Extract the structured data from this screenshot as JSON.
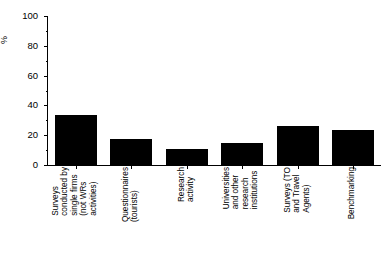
{
  "chart_data": {
    "type": "bar",
    "title": "",
    "xlabel": "",
    "ylabel": "%",
    "ylim": [
      0,
      100
    ],
    "grid": false,
    "legend": false,
    "categories": [
      "Surveys conducted by single firms (not WRs activities)",
      "Questionnaires (tourists)",
      "Research activity",
      "Universities and other research institutions",
      "Surveys (TO and Travel Agents)",
      "Benchmarking"
    ],
    "category_lines": [
      [
        "Surveys",
        "conducted by",
        "single firms",
        "(not WRs",
        "activities)"
      ],
      [
        "Questionnaires",
        "(tourists)"
      ],
      [
        "Research",
        "activity"
      ],
      [
        "Universities",
        "and other",
        "research",
        "institutions"
      ],
      [
        "Surveys (TO",
        "and Travel",
        "Agents)"
      ],
      [
        "Benchmarking"
      ]
    ],
    "values": [
      33.5,
      17.5,
      11,
      15,
      26,
      23.5
    ],
    "ytick_labels": [
      "0",
      "20",
      "40",
      "60",
      "80",
      "100"
    ],
    "ytick_values": [
      0,
      20,
      40,
      60,
      80,
      100
    ],
    "yminor_values": [
      10,
      30,
      50,
      70,
      90
    ],
    "bar_color": "#000000",
    "axis_color": "#000000",
    "background_color": "#ffffff"
  }
}
